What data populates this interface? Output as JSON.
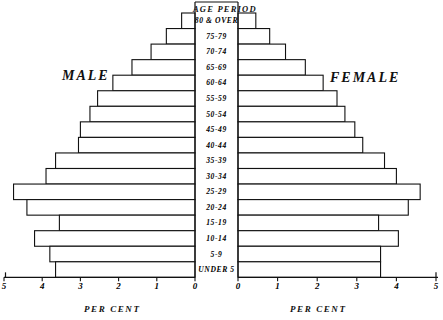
{
  "title": "AGE PERIOD",
  "side_labels": {
    "left": "MALE",
    "right": "FEMALE"
  },
  "axis_titles": {
    "left": "PER CENT",
    "right": "PER CENT"
  },
  "chart_data": {
    "type": "bar",
    "subtype": "population-pyramid",
    "title": "AGE PERIOD",
    "xlabel": "PER CENT",
    "ylabel": "AGE PERIOD",
    "xlim": [
      0,
      5
    ],
    "grid": false,
    "legend": false,
    "orientation": "horizontal",
    "categories": [
      "80 & OVER",
      "75-79",
      "70-74",
      "65-69",
      "60-64",
      "55-59",
      "50-54",
      "45-49",
      "40-44",
      "35-39",
      "30-34",
      "25-29",
      "20-24",
      "15-19",
      "10-14",
      "5-9",
      "UNDER 5"
    ],
    "series": [
      {
        "name": "MALE",
        "side": "left",
        "tick_labels": [
          "5",
          "4",
          "3",
          "2",
          "1",
          "0"
        ],
        "values": [
          0.35,
          0.75,
          1.15,
          1.65,
          2.15,
          2.55,
          2.75,
          3.0,
          3.05,
          3.65,
          3.9,
          4.75,
          4.4,
          3.55,
          4.2,
          3.8,
          3.65
        ]
      },
      {
        "name": "FEMALE",
        "side": "right",
        "tick_labels": [
          "0",
          "1",
          "2",
          "3",
          "4",
          "5"
        ],
        "values": [
          0.45,
          0.8,
          1.2,
          1.7,
          2.15,
          2.5,
          2.7,
          2.95,
          3.15,
          3.7,
          4.0,
          4.6,
          4.3,
          3.55,
          4.05,
          3.6,
          3.6
        ]
      }
    ]
  },
  "colors": {
    "ink": "#111111",
    "paper": "#ffffff",
    "bar_fill": "#ffffff"
  }
}
